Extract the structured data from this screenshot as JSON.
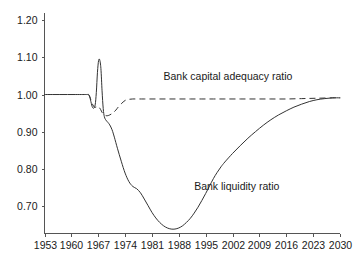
{
  "chart_data": {
    "type": "line",
    "title": "",
    "subtitle": "",
    "xlabel": "",
    "ylabel": "",
    "xlim": [
      1953,
      2030
    ],
    "ylim": [
      0.625,
      1.22
    ],
    "grid": false,
    "legend_position": "inline-annotations",
    "x_ticks": [
      "1953",
      "1960",
      "1967",
      "1974",
      "1981",
      "1988",
      "1995",
      "2002",
      "2009",
      "2016",
      "2023",
      "2030"
    ],
    "y_ticks": [
      "1.20",
      "1.10",
      "1.00",
      "0.90",
      "0.80",
      "0.70"
    ],
    "y_tick_values": [
      1.2,
      1.1,
      1.0,
      0.9,
      0.8,
      0.7
    ],
    "series": [
      {
        "name": "Bank liquidity ratio",
        "style": "solid",
        "color": "#333333",
        "label_x": 1992,
        "label_y": 0.742,
        "x": [
          1953,
          1955,
          1957,
          1959,
          1961,
          1963,
          1964,
          1964.6,
          1965,
          1965.4,
          1965.8,
          1966.2,
          1966.5,
          1966.8,
          1967.1,
          1967.4,
          1967.7,
          1968,
          1968.3,
          1968.6,
          1969,
          1969.5,
          1970,
          1970.6,
          1971.2,
          1972,
          1973,
          1974,
          1975,
          1976,
          1977,
          1978,
          1979,
          1980,
          1981,
          1982,
          1983,
          1984,
          1985,
          1986,
          1987,
          1988,
          1989,
          1990,
          1991,
          1992,
          1993,
          1994,
          1995,
          1996,
          1997,
          1998,
          1999,
          2000,
          2002,
          2004,
          2006,
          2008,
          2010,
          2012,
          2014,
          2016,
          2018,
          2020,
          2022,
          2024,
          2026,
          2028,
          2030
        ],
        "y": [
          1.0,
          1.0,
          1.0,
          1.0,
          1.0,
          1.0,
          1.0,
          0.999,
          0.985,
          0.968,
          0.963,
          0.972,
          1.005,
          1.06,
          1.092,
          1.093,
          1.07,
          1.01,
          0.962,
          0.94,
          0.931,
          0.925,
          0.918,
          0.905,
          0.885,
          0.855,
          0.82,
          0.788,
          0.765,
          0.752,
          0.746,
          0.735,
          0.718,
          0.7,
          0.682,
          0.667,
          0.655,
          0.646,
          0.64,
          0.637,
          0.637,
          0.64,
          0.646,
          0.655,
          0.666,
          0.68,
          0.696,
          0.714,
          0.733,
          0.753,
          0.773,
          0.79,
          0.805,
          0.818,
          0.841,
          0.862,
          0.882,
          0.9,
          0.917,
          0.932,
          0.945,
          0.956,
          0.966,
          0.974,
          0.981,
          0.986,
          0.989,
          0.991,
          0.991
        ]
      },
      {
        "name": "Bank capital adequacy ratio",
        "style": "dashed",
        "color": "#333333",
        "label_x": 1984,
        "label_y": 1.038,
        "x": [
          1964.4,
          1964.8,
          1965.2,
          1965.6,
          1966,
          1966.4,
          1966.8,
          1967.2,
          1967.6,
          1968,
          1968.5,
          1969,
          1969.5,
          1970,
          1970.5,
          1971,
          1971.6,
          1972.2,
          1973,
          1974,
          1975,
          1976,
          1977,
          1979,
          1982,
          1985,
          1988,
          1991,
          1994,
          1997,
          2000,
          2004,
          2008,
          2012,
          2016,
          2020,
          2024,
          2028,
          2030
        ],
        "y": [
          1.0,
          0.994,
          0.982,
          0.972,
          0.966,
          0.966,
          0.968,
          0.966,
          0.96,
          0.952,
          0.946,
          0.943,
          0.943,
          0.945,
          0.948,
          0.952,
          0.958,
          0.966,
          0.975,
          0.984,
          0.987,
          0.988,
          0.988,
          0.988,
          0.988,
          0.988,
          0.988,
          0.988,
          0.988,
          0.988,
          0.988,
          0.988,
          0.988,
          0.988,
          0.988,
          0.989,
          0.99,
          0.991,
          0.991
        ]
      }
    ]
  },
  "axes": {
    "y_axis_name": "value-axis",
    "x_axis_name": "year-axis"
  }
}
